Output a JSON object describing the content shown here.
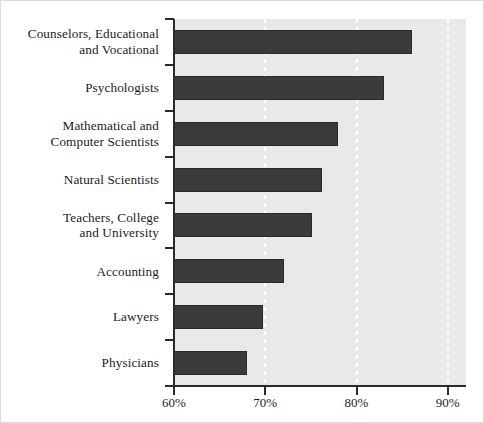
{
  "chart_data": {
    "type": "bar",
    "orientation": "horizontal",
    "title": "",
    "subtitle": "",
    "xlabel": "",
    "ylabel": "",
    "xlim": [
      60,
      92
    ],
    "grid": true,
    "grid_axis": "x",
    "legend": false,
    "legend_position": "none",
    "bar_color": "#3b3b3b",
    "plot_background": "#e9e9e9",
    "gridline_color": "#ffffff",
    "axis_color": "#2b2b2b",
    "tick_format": "percent",
    "xticks": [
      60,
      70,
      80,
      90
    ],
    "xtick_labels": [
      "60%",
      "70%",
      "80%",
      "90%"
    ],
    "categories": [
      "Counselors, Educational\nand Vocational",
      "Psychologists",
      "Mathematical and\nComputer Scientists",
      "Natural Scientists",
      "Teachers, College\nand University",
      "Accounting",
      "Lawyers",
      "Physicians"
    ],
    "values": [
      86.1,
      83.0,
      78.0,
      76.2,
      75.1,
      72.1,
      69.7,
      68.0
    ]
  }
}
